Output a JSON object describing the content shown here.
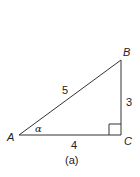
{
  "figure": {
    "caption": "(a)",
    "type": "right-triangle",
    "vertices": {
      "A": {
        "label": "A"
      },
      "B": {
        "label": "B"
      },
      "C": {
        "label": "C"
      }
    },
    "sides": {
      "AB": "5",
      "BC": "3",
      "AC": "4"
    },
    "angle_label": "α",
    "right_angle_at": "C",
    "colors": {
      "stroke": "#333333",
      "text": "#222222",
      "background": "#ffffff"
    }
  }
}
